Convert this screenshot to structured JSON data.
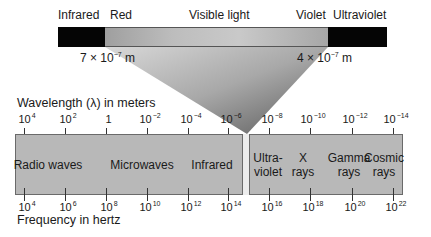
{
  "visible_band": {
    "labels": {
      "infrared": "Infrared",
      "red": "Red",
      "visible": "Visible light",
      "violet": "Violet",
      "ultraviolet": "Ultraviolet"
    },
    "red_limit": "7 × 10",
    "red_limit_exp": "−7",
    "red_limit_unit": "m",
    "violet_limit": "4 × 10",
    "violet_limit_exp": "−7",
    "violet_limit_unit": "m"
  },
  "wavelength_axis": {
    "title": "Wavelength (λ) in meters",
    "ticks": [
      {
        "base": "10",
        "exp": "4"
      },
      {
        "base": "10",
        "exp": "2"
      },
      {
        "base": "1",
        "exp": ""
      },
      {
        "base": "10",
        "exp": "−2"
      },
      {
        "base": "10",
        "exp": "−4"
      },
      {
        "base": "10",
        "exp": "−6"
      },
      {
        "base": "10",
        "exp": "−8"
      },
      {
        "base": "10",
        "exp": "−10"
      },
      {
        "base": "10",
        "exp": "−12"
      },
      {
        "base": "10",
        "exp": "−14"
      }
    ]
  },
  "frequency_axis": {
    "title": "Frequency in hertz",
    "ticks": [
      {
        "base": "10",
        "exp": "4"
      },
      {
        "base": "10",
        "exp": "6"
      },
      {
        "base": "10",
        "exp": "8"
      },
      {
        "base": "10",
        "exp": "10"
      },
      {
        "base": "10",
        "exp": "12"
      },
      {
        "base": "10",
        "exp": "14"
      },
      {
        "base": "10",
        "exp": "16"
      },
      {
        "base": "10",
        "exp": "18"
      },
      {
        "base": "10",
        "exp": "20"
      },
      {
        "base": "10",
        "exp": "22"
      }
    ]
  },
  "bands": [
    {
      "line1": "Radio waves",
      "line2": ""
    },
    {
      "line1": "Microwaves",
      "line2": ""
    },
    {
      "line1": "Infrared",
      "line2": ""
    },
    {
      "line1": "Ultra-",
      "line2": "violet"
    },
    {
      "line1": "X",
      "line2": "rays"
    },
    {
      "line1": "Gamma",
      "line2": "rays"
    },
    {
      "line1": "Cosmic",
      "line2": "rays"
    }
  ],
  "colors": {
    "bar_fill": "#b8b8b8",
    "black_segments": "#050505",
    "visible_strip": "#ececec"
  }
}
